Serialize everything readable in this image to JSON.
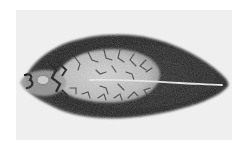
{
  "image": {
    "subject": "liver fluke specimen (flatworm), dorsal view",
    "style": "grayscale photograph",
    "orientation": "anterior end left, posterior end right"
  },
  "colors": {
    "page_background": "#ffffff",
    "panel_background": "#efefef",
    "body_dark": "#1e1e1e",
    "body_mid": "#3a3a3a",
    "interior_light": "#bdbdbd",
    "interior_highlight": "#d6d6d6",
    "branch_lines": "#2a2a2a",
    "midline": "#e8e8e8"
  },
  "structures": {
    "anterior_mark": "3",
    "features": [
      "oral sucker",
      "ventral sucker",
      "branched intestinal caeca",
      "median excretory canal"
    ]
  }
}
